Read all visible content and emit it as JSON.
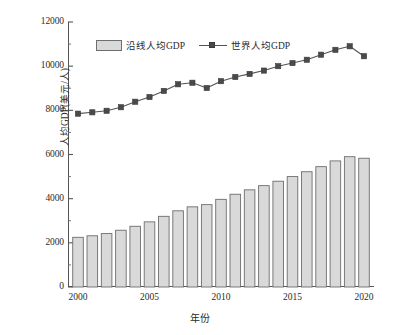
{
  "chart_data": {
    "type": "bar",
    "title": "",
    "xlabel": "年份",
    "ylabel": "人均GDP(美元/人)",
    "xlim": [
      1999.3,
      2020.7
    ],
    "ylim": [
      0,
      12000
    ],
    "ytick_values": [
      0,
      2000,
      4000,
      6000,
      8000,
      10000,
      12000
    ],
    "ytick_labels": [
      "0",
      "2000",
      "4000",
      "6000",
      "8000",
      "10000",
      "12000"
    ],
    "yminor_step": 1000,
    "xtick_values": [
      2000,
      2005,
      2010,
      2015,
      2020
    ],
    "xtick_labels": [
      "2000",
      "2005",
      "2010",
      "2015",
      "2020"
    ],
    "grid": false,
    "legend_position": "upper-left-inside",
    "categories": [
      2000,
      2001,
      2002,
      2003,
      2004,
      2005,
      2006,
      2007,
      2008,
      2009,
      2010,
      2011,
      2012,
      2013,
      2014,
      2015,
      2016,
      2017,
      2018,
      2019,
      2020
    ],
    "series": [
      {
        "name": "沿线人均GDP",
        "kind": "bar",
        "color": "#d9d9d9",
        "edge_color": "#6e6e6e",
        "values": [
          2250,
          2320,
          2420,
          2570,
          2750,
          2950,
          3200,
          3450,
          3630,
          3730,
          3970,
          4200,
          4400,
          4590,
          4790,
          5000,
          5220,
          5450,
          5710,
          5900,
          5830
        ]
      },
      {
        "name": "世界人均GDP",
        "kind": "line",
        "color": "#545454",
        "marker": "square",
        "values": [
          7850,
          7910,
          7980,
          8140,
          8390,
          8600,
          8880,
          9180,
          9250,
          9010,
          9320,
          9510,
          9650,
          9800,
          10000,
          10140,
          10290,
          10520,
          10740,
          10900,
          10450
        ]
      }
    ]
  },
  "legend": {
    "bar_label": "沿线人均GDP",
    "line_label": "世界人均GDP"
  },
  "axes": {
    "y_title": "人均GDP(美元/人)",
    "x_title": "年份"
  }
}
